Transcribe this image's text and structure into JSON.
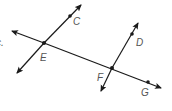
{
  "diagram": {
    "colors": {
      "line": "#1a1a1a",
      "label": "#555555",
      "background": "#ffffff"
    },
    "edge_fragment": "c.",
    "points": {
      "C": "C",
      "E": "E",
      "D": "D",
      "F": "F",
      "G": "G"
    },
    "lines": [
      {
        "name": "transversal",
        "through": [
          "E",
          "F",
          "G"
        ]
      },
      {
        "name": "line-EC",
        "through": [
          "E",
          "C"
        ]
      },
      {
        "name": "line-FD",
        "through": [
          "F",
          "D"
        ]
      }
    ]
  }
}
